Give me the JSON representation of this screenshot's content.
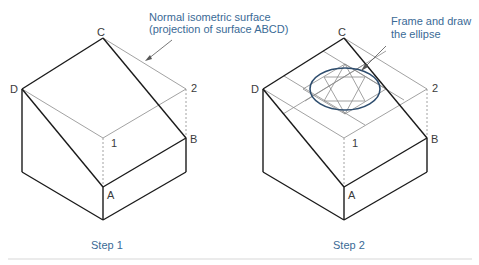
{
  "figures": [
    {
      "id": "step1",
      "caption": "Step 1",
      "annotation": [
        "Normal isometric surface",
        "(projection of surface ABCD)"
      ],
      "labels": {
        "C": "C",
        "D": "D",
        "two": "2",
        "one": "1",
        "B": "B",
        "A": "A"
      }
    },
    {
      "id": "step2",
      "caption": "Step 2",
      "annotation": [
        "Frame and draw",
        "the ellipse"
      ],
      "labels": {
        "C": "C",
        "D": "D",
        "two": "2",
        "one": "1",
        "B": "B",
        "A": "A"
      }
    }
  ],
  "colors": {
    "line": "#1a1a1a",
    "construction": "#8a8a8a",
    "annotation": "#3a6a96",
    "ellipse": "#2e4d6e",
    "rule": "#d8d8d8"
  }
}
